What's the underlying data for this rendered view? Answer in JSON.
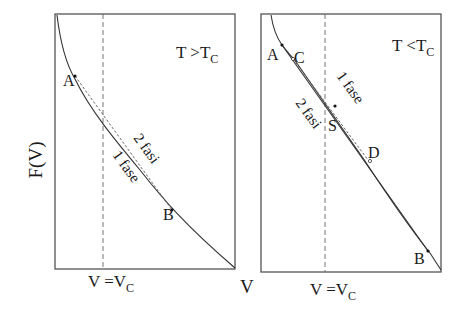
{
  "figure": {
    "y_axis_label": "F(V)",
    "x_axis_label": "V",
    "panels": [
      {
        "id": "left",
        "condition": {
          "base": "T >T",
          "sub": "C"
        },
        "vline_label": {
          "base": "V =V",
          "sub": "C"
        },
        "points": [
          {
            "label": "A"
          },
          {
            "label": "B"
          }
        ],
        "curve_labels": {
          "two_phase": "2 fasi",
          "one_phase": "1 fase"
        }
      },
      {
        "id": "right",
        "condition": {
          "base": "T <T",
          "sub": "C"
        },
        "vline_label": {
          "base": "V =V",
          "sub": "C"
        },
        "points": [
          {
            "label": "A"
          },
          {
            "label": "C"
          },
          {
            "label": "S"
          },
          {
            "label": "D"
          },
          {
            "label": "B"
          }
        ],
        "curve_labels": {
          "one_phase": "1 fase",
          "two_phase": "2 fasi"
        }
      }
    ]
  }
}
